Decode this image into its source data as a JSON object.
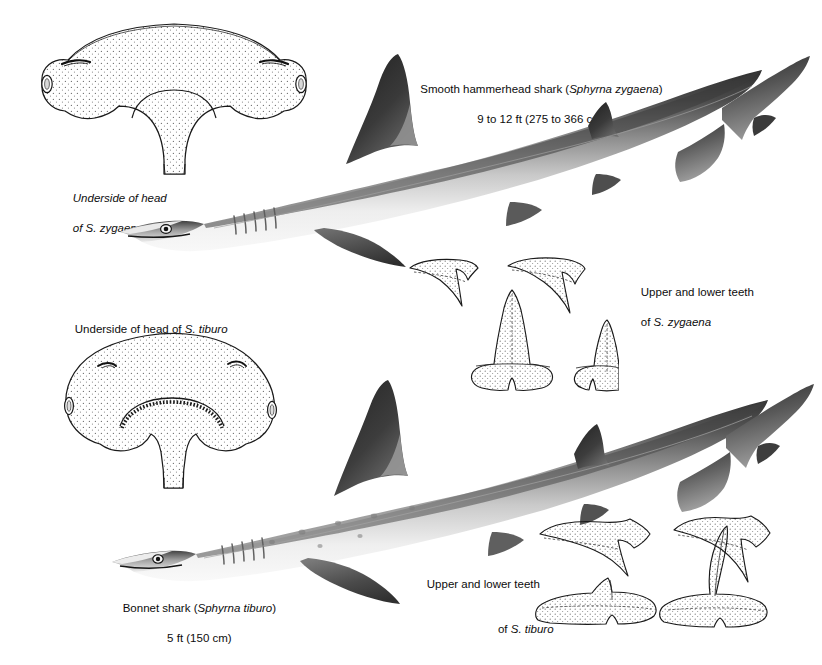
{
  "plate": {
    "title": "Hammerhead shark comparative plate",
    "background": "#ffffff",
    "ink": "#0d0d0d"
  },
  "captions": {
    "zygaena_title_line1_pre": "Smooth hammerhead shark (",
    "zygaena_title_line1_species": "Sphyrna zygaena",
    "zygaena_title_line1_post": ")",
    "zygaena_title_line2": "9 to 12 ft (275 to 366 cm)",
    "zygaena_head_line1": "Underside of head",
    "zygaena_head_line2": "of S. zygaena",
    "tiburo_head_pre": "Underside of head of ",
    "tiburo_head_species": "S. tiburo",
    "zygaena_teeth_line1": "Upper and lower teeth",
    "zygaena_teeth_line2_pre": "of ",
    "zygaena_teeth_line2_species": "S. zygaena",
    "tiburo_teeth_line1": "Upper and lower teeth",
    "tiburo_teeth_line2_pre": "of ",
    "tiburo_teeth_line2_species": "S. tiburo",
    "tiburo_title_line1_pre": "Bonnet shark (",
    "tiburo_title_line1_species": "Sphyrna tiburo",
    "tiburo_title_line1_post": ")",
    "tiburo_title_line2": "5 ft (150 cm)"
  },
  "figures": {
    "zygaena_head": "underside-of-head-sphyrna-zygaena",
    "tiburo_head": "underside-of-head-sphyrna-tiburo",
    "zygaena_body": "lateral-view-sphyrna-zygaena",
    "tiburo_body": "lateral-view-sphyrna-tiburo",
    "zygaena_teeth": "teeth-set-sphyrna-zygaena",
    "tiburo_teeth": "teeth-set-sphyrna-tiburo"
  },
  "colors": {
    "dorsal_dark": "#2b2b2b",
    "mid_gray": "#8d8d8d",
    "ventral_light": "#f2f2f2",
    "outline": "#1a1a1a",
    "stipple": "#6e6e6e"
  }
}
